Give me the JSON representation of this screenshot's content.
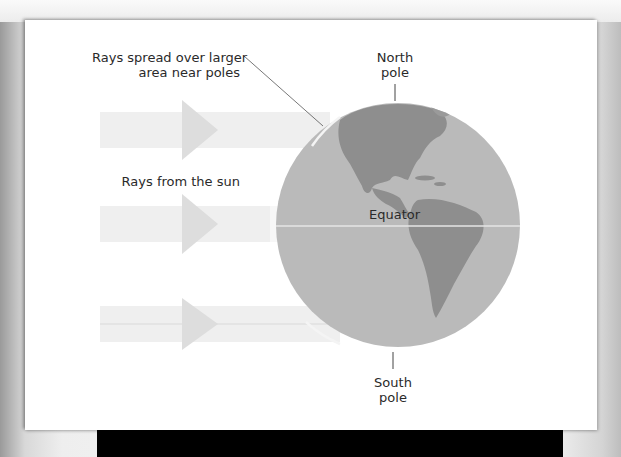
{
  "diagram": {
    "title_hint": "Sunlight striking Earth at different latitudes",
    "labels": {
      "rays_spread_line1": "Rays spread over larger",
      "rays_spread_line2": "area near poles",
      "rays_from_sun": "Rays from the sun",
      "north_pole_line1": "North",
      "north_pole_line2": "pole",
      "equator": "Equator",
      "south_pole_line1": "South",
      "south_pole_line2": "pole"
    },
    "colors": {
      "card_background": "#ffffff",
      "arrow_fill": "#ececec",
      "arrow_head": "#dcdcdc",
      "globe_ocean": "#b9b9b9",
      "globe_land": "#8c8c8c",
      "equator_line": "#e6e6e6",
      "leader_line": "#555555",
      "text": "#2a2a2a"
    },
    "arrows": [
      {
        "name": "upper-ray",
        "y": 130
      },
      {
        "name": "middle-ray",
        "y": 222
      },
      {
        "name": "lower-ray",
        "y": 323
      }
    ]
  }
}
